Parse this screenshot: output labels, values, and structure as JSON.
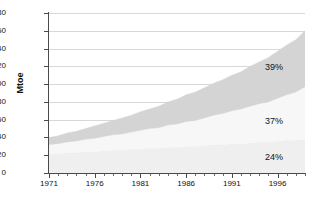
{
  "chart_data": {
    "type": "area",
    "title": "",
    "xlabel": "",
    "ylabel": "Mtoe",
    "ylim": [
      0,
      180
    ],
    "ytick_step": 20,
    "ytick_labels": [
      "0",
      "20",
      "40",
      "60",
      "80",
      "100",
      "120",
      "140",
      "160",
      "180"
    ],
    "xlim": [
      1971,
      1999
    ],
    "xtick_labels": [
      "1971",
      "1976",
      "1981",
      "1986",
      "1991",
      "1996"
    ],
    "xtick_values": [
      1971,
      1976,
      1981,
      1986,
      1991,
      1996
    ],
    "x_minor_step": 1,
    "grid": true,
    "legend": "none",
    "stacked": true,
    "x": [
      1971,
      1972,
      1973,
      1974,
      1975,
      1976,
      1977,
      1978,
      1979,
      1980,
      1981,
      1982,
      1983,
      1984,
      1985,
      1986,
      1987,
      1988,
      1989,
      1990,
      1991,
      1992,
      1993,
      1994,
      1995,
      1996,
      1997,
      1998,
      1999
    ],
    "series": [
      {
        "name": "bottom-band",
        "share_label": "24%",
        "color": "#efefef",
        "values": [
          22,
          22,
          23,
          23,
          24,
          24,
          25,
          26,
          26,
          27,
          27,
          28,
          28,
          29,
          29,
          30,
          30,
          31,
          32,
          32,
          33,
          33,
          34,
          35,
          35,
          36,
          37,
          37,
          38
        ]
      },
      {
        "name": "middle-band",
        "share_label": "37%",
        "color": "#f7f7f7",
        "values": [
          10,
          11,
          12,
          13,
          14,
          15,
          16,
          17,
          18,
          19,
          21,
          22,
          23,
          25,
          26,
          28,
          29,
          31,
          33,
          35,
          37,
          39,
          41,
          43,
          45,
          48,
          51,
          54,
          59
        ]
      },
      {
        "name": "top-band",
        "share_label": "39%",
        "color": "#d4d4d4",
        "values": [
          8,
          9,
          10,
          11,
          12,
          14,
          15,
          16,
          18,
          19,
          21,
          22,
          24,
          26,
          28,
          30,
          32,
          34,
          36,
          38,
          40,
          42,
          45,
          47,
          50,
          53,
          56,
          59,
          63
        ]
      }
    ],
    "totals": [
      40,
      42,
      45,
      47,
      50,
      53,
      56,
      59,
      62,
      65,
      69,
      72,
      75,
      80,
      83,
      88,
      91,
      96,
      101,
      105,
      110,
      114,
      120,
      125,
      130,
      137,
      144,
      150,
      160
    ],
    "annotations": [
      {
        "text": "39%",
        "x_px": 265,
        "y_px": 62
      },
      {
        "text": "37%",
        "x_px": 265,
        "y_px": 116
      },
      {
        "text": "24%",
        "x_px": 265,
        "y_px": 152
      }
    ]
  }
}
